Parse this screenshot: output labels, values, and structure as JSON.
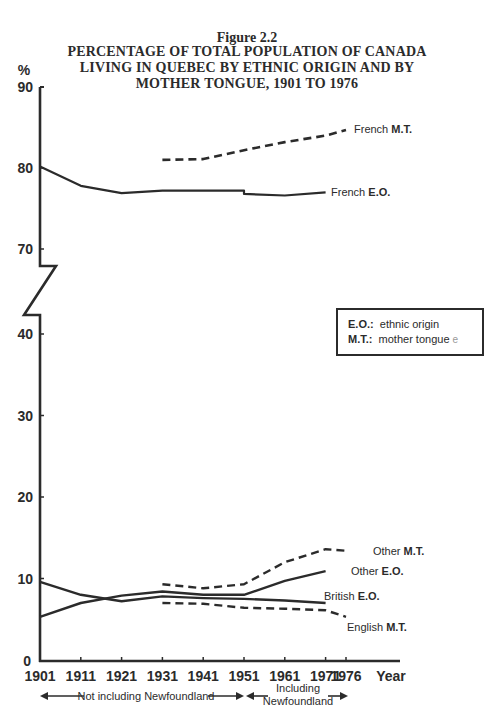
{
  "figure": {
    "number": "Figure 2.2",
    "title_lines": [
      "PERCENTAGE OF TOTAL POPULATION OF CANADA",
      "LIVING IN QUEBEC BY ETHNIC ORIGIN AND BY",
      "MOTHER TONGUE, 1901 TO 1976"
    ],
    "y_unit": "%",
    "x_axis_name": "Year"
  },
  "legend": {
    "items": [
      {
        "key": "E.O.:",
        "text": "ethnic origin"
      },
      {
        "key": "M.T.:",
        "text": "mother tongue"
      }
    ],
    "stray_mark": "e"
  },
  "annotations": {
    "left_span": "Not including Newfoundland",
    "right_span_line1": "Including",
    "right_span_line2": "Newfoundland"
  },
  "series_labels": {
    "french_mt": {
      "name": "French",
      "code": "M.T."
    },
    "french_eo": {
      "name": "French",
      "code": "E.O."
    },
    "other_mt": {
      "name": "Other",
      "code": "M.T."
    },
    "other_eo": {
      "name": "Other",
      "code": "E.O."
    },
    "british_eo": {
      "name": "British",
      "code": "E.O."
    },
    "english_mt": {
      "name": "English",
      "code": "M.T."
    }
  },
  "chart_data": {
    "type": "line",
    "title": "PERCENTAGE OF TOTAL POPULATION OF CANADA LIVING IN QUEBEC BY ETHNIC ORIGIN AND BY MOTHER TONGUE, 1901 TO 1976",
    "subtitle": "Figure 2.2",
    "xlabel": "Year",
    "ylabel": "%",
    "x": [
      1901,
      1911,
      1921,
      1931,
      1941,
      1951,
      1961,
      1971,
      1976
    ],
    "x_tick_labels": [
      "1901",
      "1911",
      "1921",
      "1931",
      "1941",
      "1951",
      "1961",
      "1971",
      "1976"
    ],
    "y_tick_labels": [
      "0",
      "10",
      "20",
      "30",
      "40",
      "70",
      "80",
      "90"
    ],
    "ylim": [
      0,
      90
    ],
    "y_axis_break": [
      42,
      68
    ],
    "grid": false,
    "series": [
      {
        "name": "French E.O.",
        "style": "solid",
        "values": [
          80.2,
          77.8,
          76.9,
          77.2,
          77.2,
          77.2,
          76.6,
          77.0,
          null
        ],
        "note": "1951 value drops to 76.8 when Newfoundland included"
      },
      {
        "name": "French M.T.",
        "style": "dashed",
        "values": [
          null,
          null,
          null,
          81.0,
          81.1,
          82.2,
          83.2,
          84.0,
          84.7
        ]
      },
      {
        "name": "Other M.T.",
        "style": "dashed",
        "values": [
          null,
          null,
          null,
          9.3,
          8.8,
          9.3,
          12.0,
          13.6,
          13.4
        ]
      },
      {
        "name": "Other E.O.",
        "style": "solid",
        "values": [
          5.3,
          7.0,
          7.9,
          8.4,
          8.0,
          8.0,
          9.7,
          10.9,
          null
        ]
      },
      {
        "name": "British E.O.",
        "style": "solid",
        "values": [
          9.6,
          8.0,
          7.2,
          7.8,
          7.6,
          7.5,
          7.3,
          7.0,
          null
        ]
      },
      {
        "name": "English M.T.",
        "style": "dashed",
        "values": [
          null,
          null,
          null,
          7.0,
          6.9,
          6.4,
          6.3,
          6.1,
          5.3
        ]
      }
    ],
    "legend": [
      "E.O.: ethnic origin",
      "M.T.: mother tongue"
    ],
    "annotations": [
      "Not including Newfoundland (1901–1951)",
      "Including Newfoundland (1951–1976)"
    ]
  }
}
